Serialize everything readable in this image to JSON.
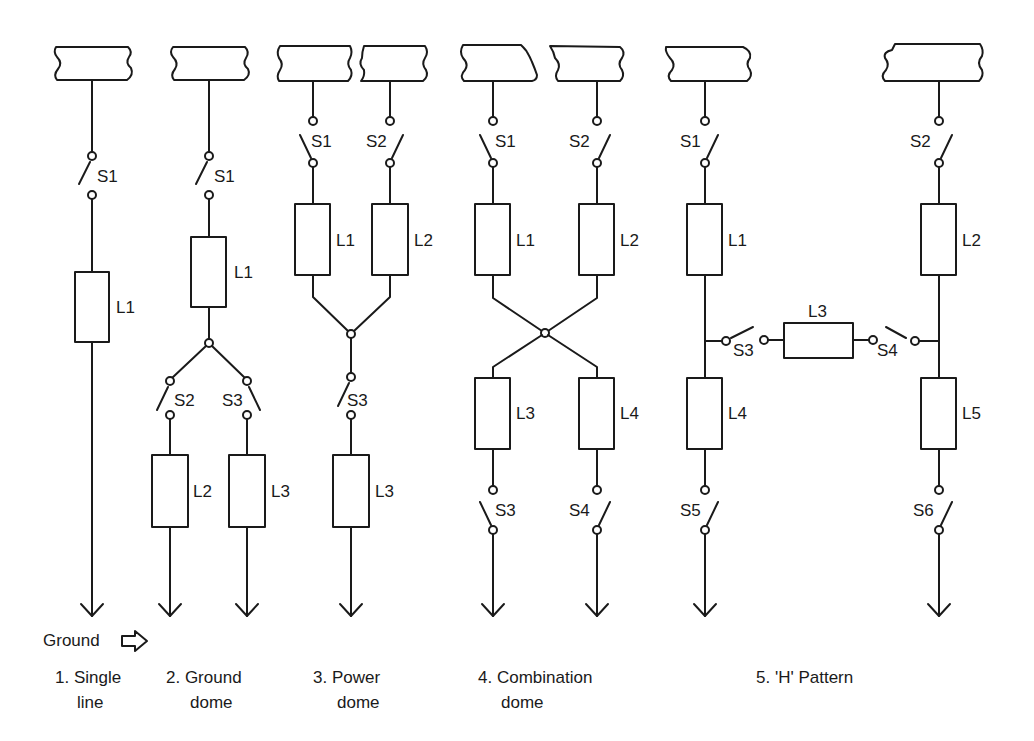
{
  "figure": {
    "ground_label": "Ground",
    "ground_icon": "hollow-right-arrow-icon",
    "colors": {
      "ink": "#1a1a1a",
      "background": "#ffffff"
    }
  },
  "diagrams": [
    {
      "caption_line1": "1. Single",
      "caption_line2": "line",
      "switches": [
        "S1"
      ],
      "loads": [
        "L1"
      ]
    },
    {
      "caption_line1": "2. Ground",
      "caption_line2": "dome",
      "switches": [
        "S1",
        "S2",
        "S3"
      ],
      "loads": [
        "L1",
        "L2",
        "L3"
      ]
    },
    {
      "caption_line1": "3. Power",
      "caption_line2": "dome",
      "switches": [
        "S1",
        "S2",
        "S3"
      ],
      "loads": [
        "L1",
        "L2",
        "L3"
      ]
    },
    {
      "caption_line1": "4. Combination",
      "caption_line2": "dome",
      "switches": [
        "S1",
        "S2",
        "S3",
        "S4"
      ],
      "loads": [
        "L1",
        "L2",
        "L3",
        "L4"
      ]
    },
    {
      "caption_line1": "5. 'H' Pattern",
      "caption_line2": "",
      "switches": [
        "S1",
        "S2",
        "S3",
        "S4",
        "S5",
        "S6"
      ],
      "loads": [
        "L1",
        "L2",
        "L3",
        "L4",
        "L5"
      ]
    }
  ]
}
